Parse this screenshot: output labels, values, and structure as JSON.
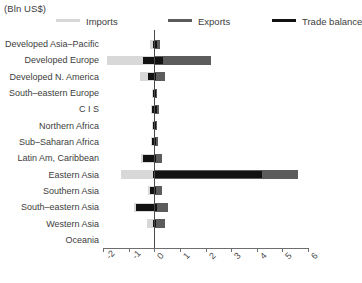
{
  "header": {
    "unit_title": "(Bln US$)"
  },
  "legend": {
    "position": "top",
    "items": [
      {
        "label": "Imports",
        "color": "#d8d8d8",
        "key": "imports"
      },
      {
        "label": "Exports",
        "color": "#5c5c5c",
        "key": "exports"
      },
      {
        "label": "Trade balance",
        "color": "#121212",
        "key": "balance"
      }
    ]
  },
  "chart_data": {
    "type": "bar",
    "orientation": "horizontal",
    "title": "(Bln US$)",
    "xlabel": "",
    "ylabel": "",
    "xlim": [
      -2,
      6
    ],
    "xticks": [
      -2,
      -1,
      0,
      1,
      2,
      3,
      4,
      5,
      6
    ],
    "xticklabels": [
      "-2",
      "-1",
      "0",
      "1",
      "2",
      "3",
      "4",
      "5",
      "6"
    ],
    "grid": false,
    "zero_line": true,
    "categories": [
      "Developed Asia–Pacific",
      "Developed Europe",
      "Developed N. America",
      "South–eastern Europe",
      "C I S",
      "Northern Africa",
      "Sub–Saharan Africa",
      "Latin Am, Caribbean",
      "Eastern Asia",
      "Southern Asia",
      "South–eastern Asia",
      "Western Asia",
      "Oceania"
    ],
    "series": [
      {
        "name": "Imports",
        "color": "#d8d8d8",
        "values": [
          -0.15,
          -1.85,
          -0.55,
          -0.1,
          -0.12,
          -0.08,
          -0.12,
          -0.5,
          -1.3,
          -0.25,
          -0.8,
          -0.3,
          -0.02
        ]
      },
      {
        "name": "Exports",
        "color": "#5c5c5c",
        "values": [
          0.22,
          2.2,
          0.42,
          0.12,
          0.18,
          0.1,
          0.14,
          0.32,
          5.6,
          0.3,
          0.55,
          0.42,
          0.03
        ]
      },
      {
        "name": "Trade balance",
        "color": "#121212",
        "values": [
          0.1,
          0.35,
          0.0,
          0.05,
          0.08,
          0.04,
          0.05,
          -0.3,
          4.2,
          0.12,
          -0.35,
          0.18,
          0.01
        ]
      }
    ],
    "balance_spans": [
      {
        "from": -0.06,
        "to": 0.12
      },
      {
        "from": -0.45,
        "to": 0.35
      },
      {
        "from": -0.26,
        "to": 0.08
      },
      {
        "from": -0.06,
        "to": 0.07
      },
      {
        "from": -0.1,
        "to": 0.1
      },
      {
        "from": -0.05,
        "to": 0.05
      },
      {
        "from": -0.08,
        "to": 0.08
      },
      {
        "from": -0.44,
        "to": 0.08
      },
      {
        "from": -0.05,
        "to": 4.2
      },
      {
        "from": -0.16,
        "to": 0.08
      },
      {
        "from": -0.72,
        "to": 0.1
      },
      {
        "from": -0.05,
        "to": 0.06
      },
      {
        "from": 0.0,
        "to": 0.0
      }
    ]
  },
  "axis": {
    "zero_label": "0"
  }
}
